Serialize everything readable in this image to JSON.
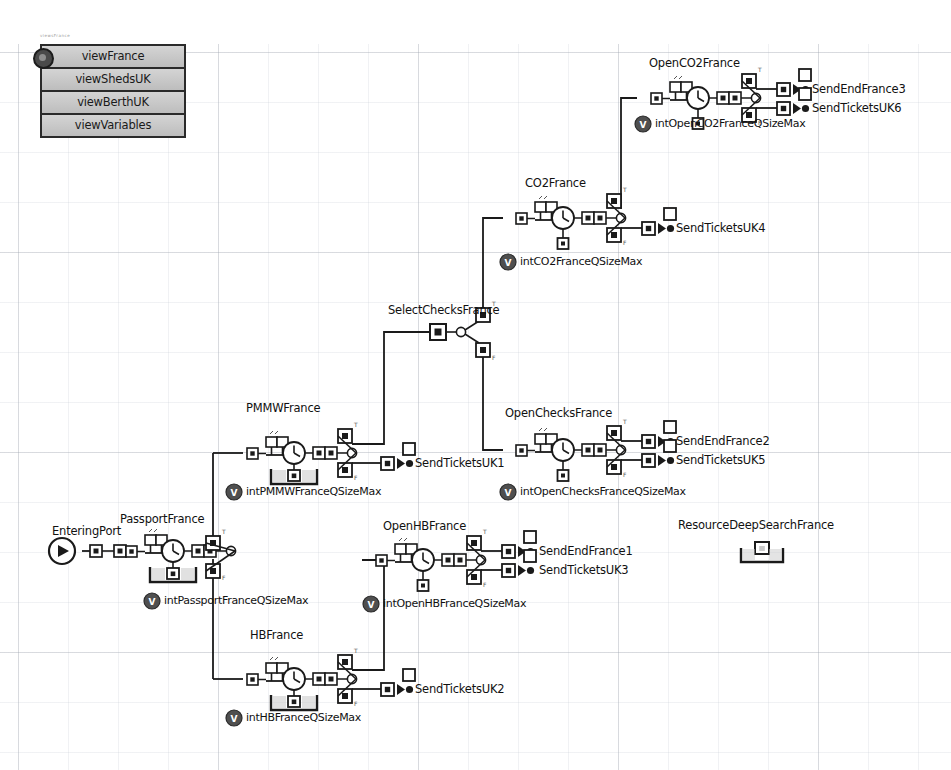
{
  "window": {
    "title": "viewFrance process flow",
    "canvas_label": "simulation-canvas"
  },
  "view_panel": {
    "tiny_caption": "viewsFrance",
    "badge_icon": "window-badge-icon",
    "buttons": [
      {
        "label": "viewFrance"
      },
      {
        "label": "viewShedsUK"
      },
      {
        "label": "viewBerthUK"
      },
      {
        "label": "viewVariables"
      }
    ]
  },
  "diagram": {
    "start_node": {
      "label": "EnteringPort",
      "icon": "start-play-icon"
    },
    "activities": [
      {
        "id": "passportfrance",
        "label": "PassportFrance",
        "variable": "intPassportFranceQSizeMax",
        "sub_icon": "resource-bracket-icon"
      },
      {
        "id": "pmmwfrance",
        "label": "PMMWFrance",
        "variable": "intPMMWFranceQSizeMax",
        "sub_icon": "resource-bracket-icon"
      },
      {
        "id": "hbfrance",
        "label": "HBFrance",
        "variable": "intHBFranceQSizeMax",
        "sub_icon": "resource-bracket-icon"
      },
      {
        "id": "openhbfrance",
        "label": "OpenHBFrance",
        "variable": "intOpenHBFranceQSizeMax",
        "sub_icon": "small-resource-icon"
      },
      {
        "id": "openchecksfrance",
        "label": "OpenChecksFrance",
        "variable": "intOpenChecksFranceQSizeMax",
        "sub_icon": "small-resource-icon"
      },
      {
        "id": "co2france",
        "label": "CO2France",
        "variable": "intCO2FranceQSizeMax",
        "sub_icon": "small-resource-icon"
      },
      {
        "id": "openco2france",
        "label": "OpenCO2France",
        "variable": "intOpenCO2FranceQSizeMax",
        "sub_icon": "small-resource-icon"
      }
    ],
    "router": {
      "id": "selectchecksfrance",
      "label": "SelectChecksFrance"
    },
    "standalone": {
      "label": "ResourceDeepSearchFrance",
      "icon": "resource-bracket-icon"
    },
    "terminators": [
      {
        "id": "t1",
        "label": "SendTicketsUK1"
      },
      {
        "id": "t2",
        "label": "SendTicketsUK2"
      },
      {
        "id": "t3",
        "label": "SendEndFrance1"
      },
      {
        "id": "t4",
        "label": "SendTicketsUK3"
      },
      {
        "id": "t5",
        "label": "SendEndFrance2"
      },
      {
        "id": "t6",
        "label": "SendTicketsUK5"
      },
      {
        "id": "t7",
        "label": "SendTicketsUK4"
      },
      {
        "id": "t8",
        "label": "SendEndFrance3"
      },
      {
        "id": "t9",
        "label": "SendTicketsUK6"
      }
    ],
    "branch_markers": {
      "true": "T",
      "false": "F"
    },
    "variable_icon": "variable-v-icon"
  },
  "colors": {
    "ink": "#111111",
    "grid_major": "#a0a5af",
    "grid_minor": "#bec3cd",
    "panel_fill": "#c9c9c9",
    "panel_border": "#2a2a2a",
    "node_fill": "#ffffff",
    "node_stroke": "#1a1a1a"
  }
}
